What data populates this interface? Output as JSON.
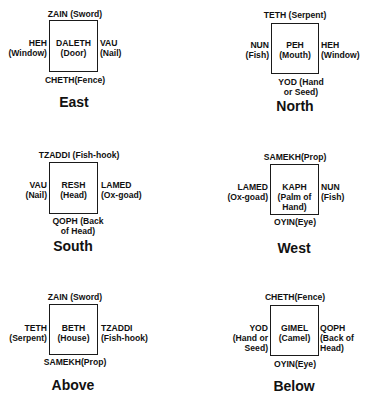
{
  "diagrams": [
    {
      "title": "East",
      "center": [
        "DALETH",
        "(Door)"
      ],
      "top": [
        "ZAIN (Sword)"
      ],
      "left": [
        "HEH",
        "(Window)"
      ],
      "right": [
        "VAU",
        "(Nail)"
      ],
      "bottom": [
        "CHETH(Fence)"
      ]
    },
    {
      "title": "North",
      "center": [
        "PEH",
        "(Mouth)"
      ],
      "top": [
        "TETH (Serpent)"
      ],
      "left": [
        "NUN",
        "(Fish)"
      ],
      "right": [
        "HEH",
        "(Window)"
      ],
      "bottom": [
        "YOD (Hand",
        "or Seed)"
      ]
    },
    {
      "title": "South",
      "center": [
        "RESH",
        "(Head)"
      ],
      "top": [
        "TZADDI (Fish-hook)"
      ],
      "left": [
        "VAU",
        "(Nail)"
      ],
      "right": [
        "LAMED",
        "(Ox-goad)"
      ],
      "bottom": [
        "QOPH (Back",
        "of Head)"
      ]
    },
    {
      "title": "West",
      "center": [
        "KAPH",
        "(Palm of",
        "Hand)"
      ],
      "top": [
        "SAMEKH(Prop)"
      ],
      "left": [
        "LAMED",
        "(Ox-goad)"
      ],
      "right": [
        "NUN",
        "(Fish)"
      ],
      "bottom": [
        "OYIN(Eye)"
      ]
    },
    {
      "title": "Above",
      "center": [
        "BETH",
        "(House)"
      ],
      "top": [
        "ZAIN (Sword)"
      ],
      "left": [
        "TETH",
        "(Serpent)"
      ],
      "right": [
        "TZADDI",
        "(Fish-hook)"
      ],
      "bottom": [
        "SAMEKH(Prop)"
      ]
    },
    {
      "title": "Below",
      "center": [
        "GIMEL",
        "(Camel)"
      ],
      "top": [
        "CHETH(Fence)"
      ],
      "left": [
        "YOD",
        "(Hand or",
        "Seed)"
      ],
      "right": [
        "QOPH",
        "(Back of",
        "Head)"
      ],
      "bottom": [
        "OYIN(Eye)"
      ]
    }
  ]
}
